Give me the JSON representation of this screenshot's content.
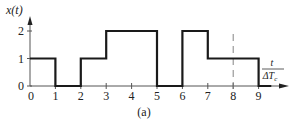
{
  "chart_data": {
    "type": "line",
    "step": true,
    "title": "",
    "caption": "(a)",
    "ylabel": "x(t)",
    "xlabel_num": "t",
    "xlabel_den": "ΔT",
    "xlabel_den_sub": "c",
    "xlim": [
      0,
      9.8
    ],
    "ylim": [
      0,
      2.4
    ],
    "xticks": [
      0,
      1,
      2,
      3,
      4,
      5,
      6,
      7,
      8,
      9
    ],
    "xtick_labels": [
      "0",
      "1",
      "2",
      "3",
      "4",
      "5",
      "6",
      "7",
      "8",
      "9"
    ],
    "yticks": [
      0,
      1,
      2
    ],
    "ytick_labels": [
      "0",
      "1",
      "2"
    ],
    "grid": false,
    "annotations": [
      {
        "type": "dashed-vertical-line",
        "x": 8
      }
    ],
    "segments": [
      {
        "x_start": 0,
        "x_end": 1,
        "value": 1
      },
      {
        "x_start": 1,
        "x_end": 2,
        "value": 0
      },
      {
        "x_start": 2,
        "x_end": 3,
        "value": 1
      },
      {
        "x_start": 3,
        "x_end": 5,
        "value": 2
      },
      {
        "x_start": 5,
        "x_end": 6,
        "value": 0
      },
      {
        "x_start": 6,
        "x_end": 7,
        "value": 2
      },
      {
        "x_start": 7,
        "x_end": 9,
        "value": 1
      },
      {
        "x_start": 9,
        "x_end": 9.5,
        "value": 0
      }
    ],
    "colors": {
      "signal": "#1a1a1a",
      "axis": "#555555"
    }
  }
}
